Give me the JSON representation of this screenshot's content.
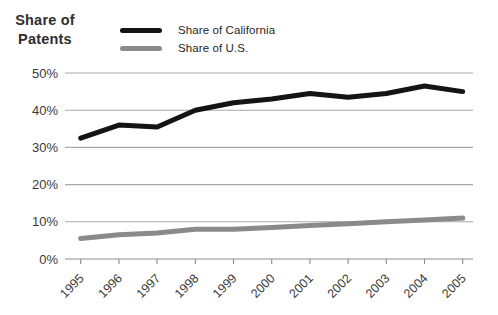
{
  "figure": {
    "y_axis_title_line1": "Share of",
    "y_axis_title_line2": "Patents"
  },
  "legend": [
    {
      "label": "Share of California",
      "color": "#141414"
    },
    {
      "label": "Share of U.S.",
      "color": "#8a8a8a"
    }
  ],
  "chart_data": {
    "type": "line",
    "title": "",
    "xlabel": "",
    "ylabel": "Share of Patents",
    "categories": [
      "1995",
      "1996",
      "1997",
      "1998",
      "1999",
      "2000",
      "2001",
      "2002",
      "2003",
      "2004",
      "2005"
    ],
    "series": [
      {
        "name": "Share of California",
        "color": "#141414",
        "values": [
          32.5,
          36,
          35.5,
          40,
          42,
          43,
          44.5,
          43.5,
          44.5,
          46.5,
          45
        ]
      },
      {
        "name": "Share of U.S.",
        "color": "#8a8a8a",
        "values": [
          5.5,
          6.5,
          7,
          8,
          8,
          8.5,
          9,
          9.5,
          10,
          10.5,
          11
        ]
      }
    ],
    "yticks": [
      "0%",
      "10%",
      "20%",
      "30%",
      "40%",
      "50%"
    ],
    "ylim": [
      0,
      50
    ],
    "grid": "horizontal",
    "legend_position": "top",
    "colors": {
      "gridline": "#a8a8a8",
      "axis": "#8c8c8c",
      "tick_text": "#3a3a3a"
    }
  }
}
